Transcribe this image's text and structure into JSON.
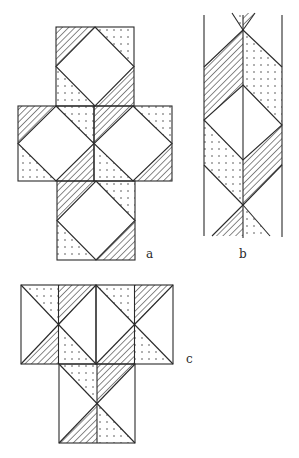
{
  "figure": {
    "colors": {
      "background": "#ffffff",
      "stroke": "#2a2a2a",
      "hatch": "#2a2a2a",
      "dots": "#3a3a3a"
    },
    "fills": [
      "plain",
      "hatched",
      "dotted"
    ],
    "panels": [
      {
        "id": "a",
        "label": "a",
        "layout": "cross of 4 squares (1 top, 2 middle, 1 bottom)",
        "square_pattern": "inscribed diamond; corner triangles TL hatched, TR dotted, BL dotted, BR hatched",
        "squares": 4
      },
      {
        "id": "b",
        "label": "b",
        "layout": "vertical strip bounded by two parallel lines with a center line",
        "pattern": "central diamond flanked by hatched and dotted chevron bands with X crossings at top and bottom"
      },
      {
        "id": "c",
        "label": "c",
        "layout": "T shape of 3 squares (2 top, 1 bottom), each split by a vertical center line",
        "square_pattern": "X diagonals; top-left dotted, top-right hatched, bottom-left hatched, bottom-right dotted",
        "squares": 3
      }
    ]
  }
}
